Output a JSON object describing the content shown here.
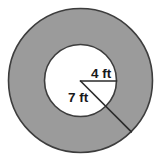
{
  "figure": {
    "kind": "annulus-radii-diagram",
    "background_color": "#ffffff",
    "ring_fill_color": "#9b9b9b",
    "inner_fill_color": "#ffffff",
    "outline_color": "#3d3d3d",
    "line_color": "#2b2b2b",
    "text_color": "#1a1a1a",
    "center": {
      "x": 80.5,
      "y": 80.5
    },
    "outer_radius_px": 72,
    "inner_radius_px": 36,
    "outline_width_px": 1.6,
    "radius_line_width_px": 1.6
  },
  "labels": {
    "inner_radius": {
      "text": "4 ft",
      "value": 4,
      "unit": "ft",
      "x": 101,
      "y": 78,
      "anchor": "middle"
    },
    "outer_radius": {
      "text": "7 ft",
      "value": 7,
      "unit": "ft",
      "x": 78,
      "y": 102,
      "anchor": "middle"
    }
  },
  "radii_lines": {
    "inner": {
      "name": "inner-radius-line",
      "x1": 80.5,
      "y1": 81,
      "x2": 116.5,
      "y2": 81
    },
    "outer": {
      "name": "outer-radius-line",
      "x1": 80.5,
      "y1": 81,
      "x2": 131.4,
      "y2": 131.9
    }
  }
}
